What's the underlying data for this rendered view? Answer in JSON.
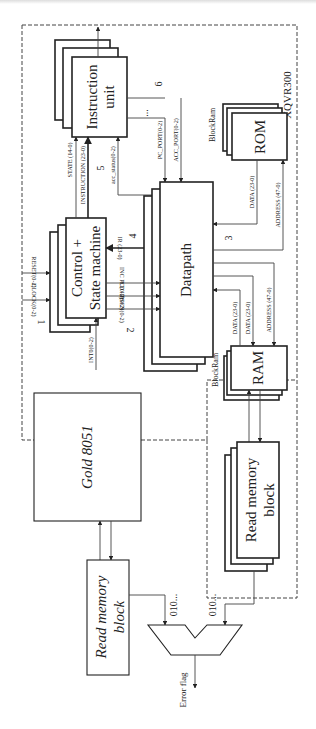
{
  "figure": {
    "orientation": "rotated-90-clockwise",
    "chip_label": "XQVR300",
    "blocks": {
      "instruction_unit": {
        "line1": "Instruction",
        "line2": "unit"
      },
      "control": {
        "line1": "Control +",
        "line2": "State machine"
      },
      "datapath": {
        "label": "Datapath"
      },
      "rom": {
        "label": "ROM",
        "tag": "BlockRam"
      },
      "ram": {
        "label": "RAM",
        "tag": "BlockRam"
      },
      "read_mem_right": {
        "line1": "Read memory",
        "line2": "block"
      },
      "gold": {
        "label": "Gold 8051"
      },
      "read_mem_left": {
        "line1": "Read memory",
        "line2": "block"
      }
    },
    "signals": {
      "state": "STATE (14-0)",
      "instruction": "INSTRUCTION (23-0)",
      "acc_status": "acc_status(0-2)",
      "pc_port": "PC_PORT(0-2)",
      "acc_port": "ACC_PORT(0-2)",
      "ir": "IR (23-0)",
      "inc_pc": "INC PC(0-2)",
      "ld_ir": "LD IR(0-2)",
      "psen": "PSEN(0-2)",
      "reset": "RESET(0-2)",
      "clock": "CLOCK(0-2)",
      "int": "INT0(0-2)",
      "rom_data": "DATA (23-0)",
      "rom_address": "ADDRESS (47-0)",
      "ram_data_in": "DATA (23-0)",
      "ram_data_out": "DATA (23-0)",
      "ram_address": "ADDRESS (47-0)",
      "stream_left": "010...",
      "stream_right": "010...",
      "error_flag": "Error flag",
      "dots": "..."
    },
    "numbers": {
      "n1": "1",
      "n2": "2",
      "n3": "3",
      "n4": "4",
      "n5": "5",
      "n6": "6"
    }
  }
}
